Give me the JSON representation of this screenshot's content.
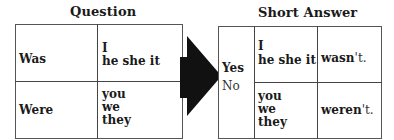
{
  "question": {
    "title": "Question",
    "rows": [
      {
        "verb": "Was",
        "subjects": [
          "I",
          "he she it"
        ]
      },
      {
        "verb": "Were",
        "subjects": [
          "you",
          "we",
          "they"
        ]
      }
    ]
  },
  "arrow": {
    "icon": "right-arrow-icon",
    "color": "#111111"
  },
  "short_answer": {
    "title": "Short Answer",
    "responses": [
      "Yes",
      "No"
    ],
    "rows": [
      {
        "subjects": [
          "I",
          "he she it"
        ],
        "answer_bold": "wasn",
        "answer_rest": "'t."
      },
      {
        "subjects": [
          "you",
          "we",
          "they"
        ],
        "answer_bold": "weren",
        "answer_rest": "'t."
      }
    ]
  }
}
